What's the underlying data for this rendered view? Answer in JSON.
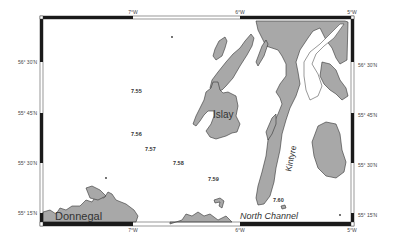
{
  "map": {
    "title": "",
    "colors": {
      "land": "#a8a8a8",
      "sea": "#ffffff",
      "coastline": "#333333",
      "frame_dark": "#1a1a1a",
      "frame_light": "#ffffff"
    },
    "longitude_labels": {
      "top": [
        "7°W",
        "6°W",
        "5°W"
      ],
      "bottom": [
        "7°W",
        "6°W",
        "5°W"
      ]
    },
    "latitude_labels": {
      "left": [
        "56° 30'N",
        "55° 45'N",
        "55° 30'N",
        "55° 15'N"
      ],
      "right": [
        "56° 30'N",
        "55° 45'N",
        "55° 30'N",
        "55° 15'N"
      ]
    },
    "place_labels": {
      "islay": "Islay",
      "kintyre": "Kintyre",
      "donnegal": "Donnegal",
      "north_channel": "North Channel"
    },
    "station_labels": [
      "7.55",
      "7.56",
      "7.57",
      "7.58",
      "7.59",
      "7.60"
    ]
  }
}
